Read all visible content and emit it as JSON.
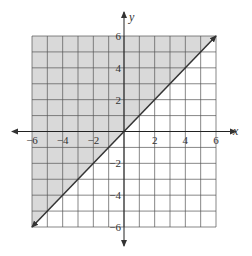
{
  "chart_data": {
    "type": "inequality-graph",
    "title": "",
    "xlabel": "x",
    "ylabel": "y",
    "xlim": [
      -6,
      6
    ],
    "ylim": [
      -6,
      6
    ],
    "grid": true,
    "grid_step": 1,
    "x_tick_labels": [
      "-6",
      "-4",
      "-2",
      "2",
      "4",
      "6"
    ],
    "x_tick_values": [
      -6,
      -4,
      -2,
      2,
      4,
      6
    ],
    "y_tick_labels": [
      "6",
      "4",
      "2",
      "-2",
      "-4",
      "-6"
    ],
    "y_tick_values": [
      6,
      4,
      2,
      -2,
      -4,
      -6
    ],
    "boundary_line": {
      "equation": "y = x",
      "slope": 1,
      "intercept": 0,
      "style": "solid",
      "arrows": "both",
      "from": [
        -6,
        -6
      ],
      "to": [
        6,
        6
      ]
    },
    "shaded_region": "y >= x (above line)",
    "shade_color": "#d9d9d9",
    "grid_color": "#555555",
    "line_color": "#333333"
  }
}
